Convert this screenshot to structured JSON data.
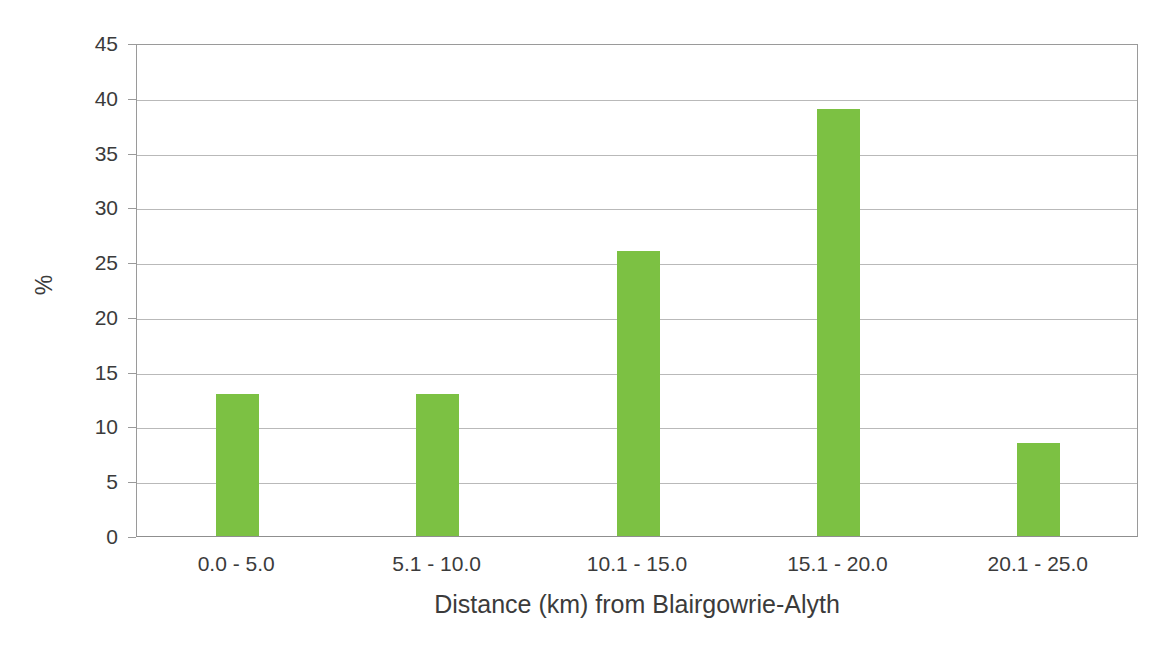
{
  "chart_data": {
    "type": "bar",
    "title": "",
    "subtitle": "",
    "categories": [
      "0.0 - 5.0",
      "5.1 - 10.0",
      "10.1 - 15.0",
      "15.1 - 20.0",
      "20.1 - 25.0"
    ],
    "values": [
      13,
      13,
      26,
      39,
      8.5
    ],
    "series": [
      {
        "name": "%",
        "values": [
          13,
          13,
          26,
          39,
          8.5
        ]
      }
    ],
    "xlabel": "Distance (km) from Blairgowrie-Alyth",
    "ylabel": "%",
    "ylim": [
      0,
      45
    ],
    "yticks": [
      0,
      5,
      10,
      15,
      20,
      25,
      30,
      35,
      40,
      45
    ],
    "ytick_labels": [
      "0",
      "5",
      "10",
      "15",
      "20",
      "25",
      "30",
      "35",
      "40",
      "45"
    ],
    "grid": "horizontal",
    "legend": "none",
    "bar_color": "#7cc143",
    "axis_color": "#9a9a9a",
    "gridline_color": "#b9b9b9",
    "text_color": "#3b3b3b",
    "background": "#ffffff",
    "annotations": []
  }
}
